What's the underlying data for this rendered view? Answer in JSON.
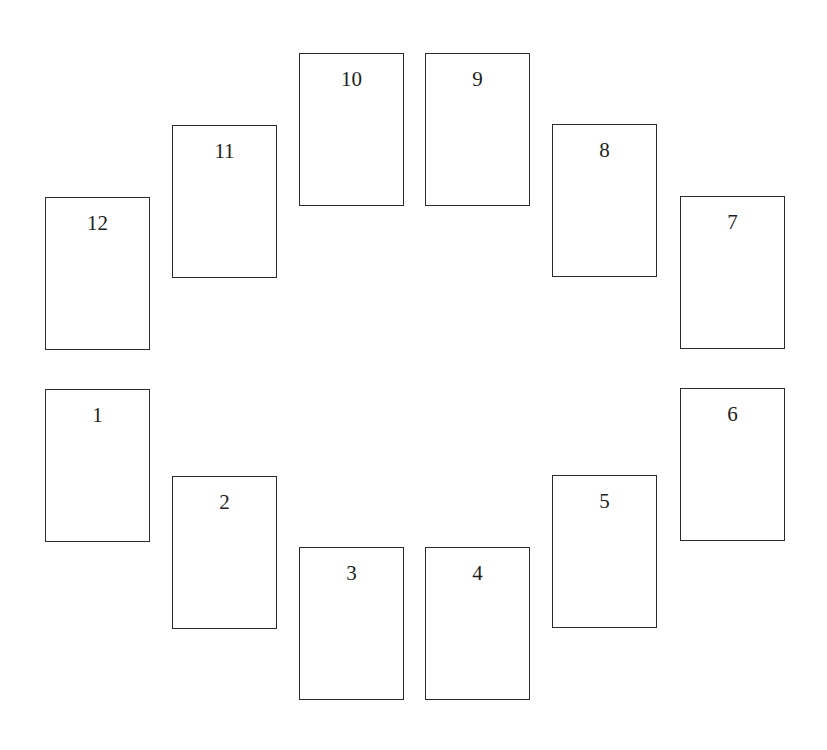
{
  "diagram": {
    "type": "card-spread",
    "layout": "ellipse",
    "card_count": 12,
    "colors": {
      "background": "#ffffff",
      "card_fill": "#ffffff",
      "card_border": "#2b2b2b",
      "text": "#1e1e1e"
    },
    "cards": [
      {
        "position": "1",
        "label": "1"
      },
      {
        "position": "2",
        "label": "2"
      },
      {
        "position": "3",
        "label": "3"
      },
      {
        "position": "4",
        "label": "4"
      },
      {
        "position": "5",
        "label": "5"
      },
      {
        "position": "6",
        "label": "6"
      },
      {
        "position": "7",
        "label": "7"
      },
      {
        "position": "8",
        "label": "8"
      },
      {
        "position": "9",
        "label": "9"
      },
      {
        "position": "10",
        "label": "10"
      },
      {
        "position": "11",
        "label": "11"
      },
      {
        "position": "12",
        "label": "12"
      }
    ]
  }
}
